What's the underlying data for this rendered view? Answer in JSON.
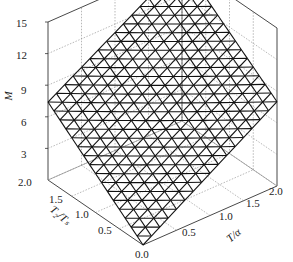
{
  "chart_data": {
    "type": "surface3d",
    "title": "",
    "zlabel": "M",
    "xlabel": "T2/Tg",
    "ylabel": "T/α",
    "z_ticks": [
      "3",
      "6",
      "9",
      "12",
      "15"
    ],
    "x_ticks": [
      "2.0",
      "1.5",
      "1.0",
      "0.5"
    ],
    "y_ticks": [
      "0.5",
      "1.0",
      "1.5",
      "2.0"
    ],
    "origin_tick": "0.0",
    "zlim": [
      0,
      15
    ],
    "xlim": [
      0,
      2.0
    ],
    "ylim": [
      0,
      2.0
    ],
    "grid": true,
    "mesh": "triangular wireframe surface rising from 0 at origin (0,0) to ~15 at (2.0,2.0)",
    "approx_surface_values": [
      {
        "x": 0.0,
        "y": 0.0,
        "z": 0
      },
      {
        "x": 2.0,
        "y": 0.0,
        "z": 7.5
      },
      {
        "x": 0.0,
        "y": 2.0,
        "z": 8
      },
      {
        "x": 2.0,
        "y": 2.0,
        "z": 14.5
      }
    ]
  },
  "labels": {
    "z_axis": "M",
    "x_axis": "T₂/Tₛ",
    "y_axis": "T/α",
    "origin": "0.0"
  }
}
